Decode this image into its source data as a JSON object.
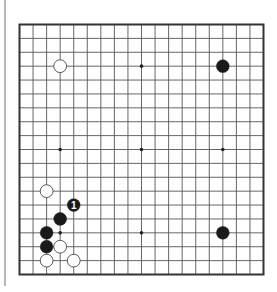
{
  "board": {
    "size": 19,
    "star_points": [
      [
        4,
        4
      ],
      [
        10,
        4
      ],
      [
        16,
        4
      ],
      [
        4,
        10
      ],
      [
        10,
        10
      ],
      [
        16,
        10
      ],
      [
        4,
        16
      ],
      [
        10,
        16
      ],
      [
        16,
        16
      ]
    ],
    "colors": {
      "line": "#555555",
      "border": "#333333",
      "black_stone": "#1a1a1a",
      "white_stone": "#ffffff",
      "white_stone_outline": "#333333",
      "label_on_black": "#ffffff"
    },
    "stones": [
      {
        "color": "white",
        "col": 4,
        "row": 4,
        "label": ""
      },
      {
        "color": "black",
        "col": 16,
        "row": 4,
        "label": ""
      },
      {
        "color": "white",
        "col": 3,
        "row": 13,
        "label": ""
      },
      {
        "color": "black",
        "col": 5,
        "row": 14,
        "label": "1"
      },
      {
        "color": "black",
        "col": 4,
        "row": 15,
        "label": ""
      },
      {
        "color": "black",
        "col": 3,
        "row": 16,
        "label": ""
      },
      {
        "color": "black",
        "col": 16,
        "row": 16,
        "label": ""
      },
      {
        "color": "black",
        "col": 3,
        "row": 17,
        "label": ""
      },
      {
        "color": "white",
        "col": 4,
        "row": 17,
        "label": ""
      },
      {
        "color": "white",
        "col": 3,
        "row": 18,
        "label": ""
      },
      {
        "color": "white",
        "col": 5,
        "row": 18,
        "label": ""
      }
    ]
  }
}
